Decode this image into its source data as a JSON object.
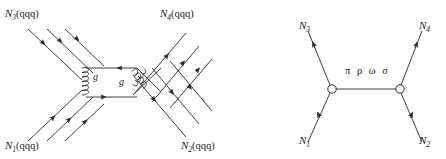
{
  "figure": {
    "type": "feynman-diagrams",
    "background_color": "#ffffff",
    "line_color": "#2a2a2a",
    "text_color": "#1a1a1a",
    "width": 446,
    "height": 159
  },
  "left_diagram": {
    "name": "quark-gluon-exchange-diagram",
    "labels": {
      "top_left": {
        "symbol": "N",
        "subscript": "3",
        "content": "(qqq)",
        "full": "N3(qqq)"
      },
      "top_right": {
        "symbol": "N",
        "subscript": "4",
        "content": "(qqq)",
        "full": "N4(qqq)"
      },
      "bottom_left": {
        "symbol": "N",
        "subscript": "1",
        "content": "(qqq)",
        "full": "N1(qqq)"
      },
      "bottom_right": {
        "symbol": "N",
        "subscript": "2",
        "content": "(qqq)",
        "full": "N2(qqq)"
      }
    },
    "gluon_labels": [
      "g",
      "g"
    ],
    "quark_lines_per_nucleon": 3
  },
  "right_diagram": {
    "name": "meson-exchange-diagram",
    "labels": {
      "top_left": {
        "symbol": "N",
        "subscript": "3",
        "full": "N3"
      },
      "top_right": {
        "symbol": "N",
        "subscript": "4",
        "full": "N4"
      },
      "bottom_left": {
        "symbol": "N",
        "subscript": "1",
        "full": "N1"
      },
      "bottom_right": {
        "symbol": "N",
        "subscript": "2",
        "full": "N2"
      }
    },
    "exchange_label": "π ρ ω σ",
    "vertex_count": 2
  }
}
